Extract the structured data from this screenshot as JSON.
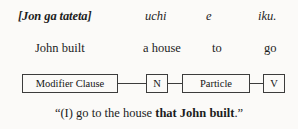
{
  "figure": {
    "background_color": "#fbfaf8",
    "text_color": "#1d1d1d",
    "border_color": "#3c3c3c"
  },
  "gloss": {
    "japanese_line": {
      "label": "japanese-transcription",
      "cells": [
        {
          "text": "[Jon ga tateta]",
          "style": "bold-italic",
          "x": 18
        },
        {
          "text": "uchi",
          "style": "italic",
          "x": 145
        },
        {
          "text": "e",
          "style": "italic",
          "x": 206
        },
        {
          "text": "iku.",
          "style": "italic",
          "x": 258
        }
      ]
    },
    "english_line": {
      "label": "english-gloss",
      "cells": [
        {
          "text": "John built",
          "x": 35
        },
        {
          "text": "a house",
          "x": 143
        },
        {
          "text": "to",
          "x": 212
        },
        {
          "text": "go",
          "x": 264
        }
      ]
    }
  },
  "diagram": {
    "nodes": [
      {
        "label": "Modifier Clause",
        "x": 22,
        "y": 74,
        "width": 96
      },
      {
        "label": "N",
        "x": 146,
        "y": 74,
        "width": 22
      },
      {
        "label": "Particle",
        "x": 182,
        "y": 74,
        "width": 68
      },
      {
        "label": "V",
        "x": 263,
        "y": 74,
        "width": 22
      }
    ],
    "connectors": [
      {
        "x": 118,
        "y": 83,
        "width": 28
      },
      {
        "x": 168,
        "y": 83,
        "width": 14
      },
      {
        "x": 250,
        "y": 83,
        "width": 13
      }
    ]
  },
  "translation": {
    "quote_open": "“",
    "plain_before": "(I) go to the house ",
    "bold_part": "that John built",
    "plain_after": ".",
    "quote_close": "”"
  }
}
